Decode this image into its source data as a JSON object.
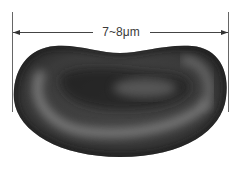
{
  "diagram": {
    "dimension_label": "7~8μm",
    "colors": {
      "cell_dark": "#2e2e2e",
      "cell_mid": "#555555",
      "cell_highlight": "#9a9a9a",
      "lines": "#555555",
      "label": "#3a3a3a"
    }
  }
}
